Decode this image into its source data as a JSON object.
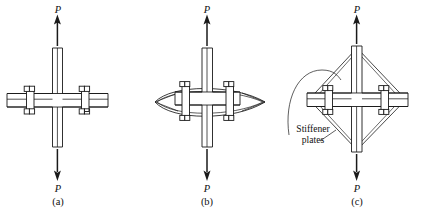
{
  "figure": {
    "kind": "engineering-diagram",
    "stroke_color": "#1a1a1a",
    "fill_color": "#ffffff",
    "background_color": "#ffffff",
    "panels": [
      {
        "id": "a",
        "caption": "(a)",
        "top_load_label": "P",
        "bottom_load_label": "P",
        "stiffener_type": "none"
      },
      {
        "id": "b",
        "caption": "(b)",
        "top_load_label": "P",
        "bottom_load_label": "P",
        "stiffener_type": "curved-lens"
      },
      {
        "id": "c",
        "caption": "(c)",
        "top_load_label": "P",
        "bottom_load_label": "P",
        "stiffener_type": "diamond",
        "annotation": "Stiffener\nplates",
        "annotation_line1": "Stiffener",
        "annotation_line2": "plates"
      }
    ]
  }
}
